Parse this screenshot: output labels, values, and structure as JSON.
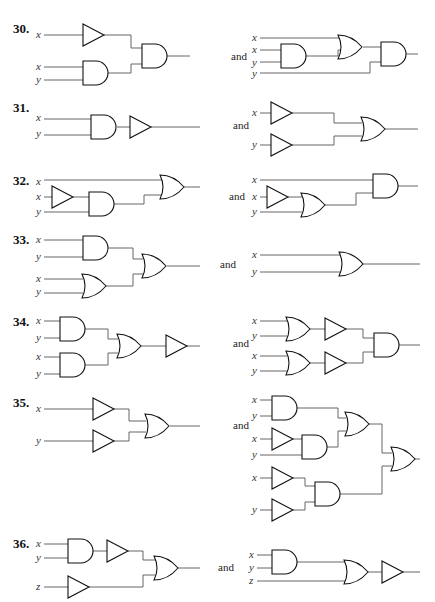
{
  "problems": [
    {
      "number": "30.",
      "connector": "and",
      "left_inputs": [
        "x",
        "x",
        "y"
      ],
      "right_inputs": [
        "x",
        "x",
        "y",
        "y"
      ]
    },
    {
      "number": "31.",
      "connector": "and",
      "left_inputs": [
        "x",
        "y"
      ],
      "right_inputs": [
        "x",
        "y"
      ]
    },
    {
      "number": "32.",
      "connector": "and",
      "left_inputs": [
        "x",
        "x",
        "y"
      ],
      "right_inputs": [
        "x",
        "x",
        "y"
      ]
    },
    {
      "number": "33.",
      "connector": "and",
      "left_inputs": [
        "x",
        "y",
        "x",
        "y"
      ],
      "right_inputs": [
        "x",
        "y"
      ]
    },
    {
      "number": "34.",
      "connector": "and",
      "left_inputs": [
        "x",
        "y",
        "x",
        "y"
      ],
      "right_inputs": [
        "x",
        "y",
        "x",
        "y"
      ]
    },
    {
      "number": "35.",
      "connector": "and",
      "left_inputs": [
        "x",
        "y"
      ],
      "right_inputs": [
        "x",
        "y",
        "x",
        "y",
        "x",
        "y"
      ]
    },
    {
      "number": "36.",
      "connector": "and",
      "left_inputs": [
        "x",
        "y",
        "z"
      ],
      "right_inputs": [
        "x",
        "y",
        "z"
      ]
    }
  ]
}
